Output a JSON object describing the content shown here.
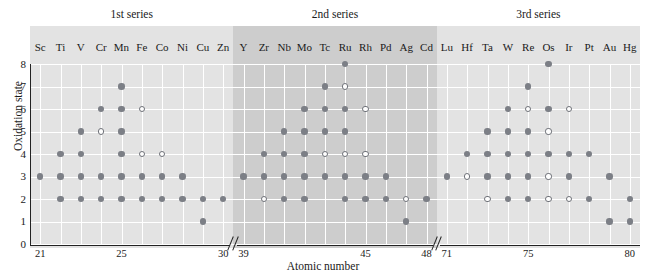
{
  "chart_data": {
    "type": "scatter",
    "title": "",
    "xlabel": "Atomic number",
    "ylabel": "Oxidation state",
    "ylim": [
      0,
      8
    ],
    "ytick_labels": [
      "0",
      "1",
      "2",
      "3",
      "4",
      "5",
      "6",
      "7",
      "8"
    ],
    "grid": true,
    "legend_position": "none",
    "axis_breaks": [
      "30/39",
      "48/71"
    ],
    "series_bands": [
      {
        "label": "1st series",
        "elements_from": "Sc",
        "elements_to": "Zn",
        "shade": "#e3e3e3"
      },
      {
        "label": "2nd series",
        "elements_from": "Y",
        "elements_to": "Cd",
        "shade": "#cdcdcd"
      },
      {
        "label": "3rd series",
        "elements_from": "Lu",
        "elements_to": "Hg",
        "shade": "#e3e3e3"
      }
    ],
    "xtick_labels": [
      "21",
      "25",
      "30",
      "39",
      "45",
      "48",
      "71",
      "75",
      "80"
    ],
    "marker_legend": {
      "filled": "common oxidation state",
      "open": "less common oxidation state"
    },
    "columns": [
      {
        "symbol": "Sc",
        "z": 21,
        "series": 1,
        "filled": [
          3
        ],
        "open": []
      },
      {
        "symbol": "Ti",
        "z": 22,
        "series": 1,
        "filled": [
          2,
          3,
          4
        ],
        "open": []
      },
      {
        "symbol": "V",
        "z": 23,
        "series": 1,
        "filled": [
          2,
          3,
          4,
          5
        ],
        "open": []
      },
      {
        "symbol": "Cr",
        "z": 24,
        "series": 1,
        "filled": [
          2,
          3,
          6
        ],
        "open": [
          5
        ]
      },
      {
        "symbol": "Mn",
        "z": 25,
        "series": 1,
        "filled": [
          2,
          3,
          4,
          5,
          6,
          7
        ],
        "open": []
      },
      {
        "symbol": "Fe",
        "z": 26,
        "series": 1,
        "filled": [
          2,
          3
        ],
        "open": [
          4,
          6
        ]
      },
      {
        "symbol": "Co",
        "z": 27,
        "series": 1,
        "filled": [
          2,
          3
        ],
        "open": [
          4
        ]
      },
      {
        "symbol": "Ni",
        "z": 28,
        "series": 1,
        "filled": [
          2,
          3
        ],
        "open": []
      },
      {
        "symbol": "Cu",
        "z": 29,
        "series": 1,
        "filled": [
          1,
          2
        ],
        "open": []
      },
      {
        "symbol": "Zn",
        "z": 30,
        "series": 1,
        "filled": [
          2
        ],
        "open": []
      },
      {
        "symbol": "Y",
        "z": 39,
        "series": 2,
        "filled": [
          3
        ],
        "open": []
      },
      {
        "symbol": "Zr",
        "z": 40,
        "series": 2,
        "filled": [
          3,
          4
        ],
        "open": [
          2
        ]
      },
      {
        "symbol": "Nb",
        "z": 41,
        "series": 2,
        "filled": [
          2,
          3,
          4,
          5
        ],
        "open": []
      },
      {
        "symbol": "Mo",
        "z": 42,
        "series": 2,
        "filled": [
          2,
          3,
          4,
          5,
          6
        ],
        "open": []
      },
      {
        "symbol": "Tc",
        "z": 43,
        "series": 2,
        "filled": [
          3,
          5,
          6,
          7
        ],
        "open": [
          4
        ]
      },
      {
        "symbol": "Ru",
        "z": 44,
        "series": 2,
        "filled": [
          2,
          3,
          5,
          6,
          8
        ],
        "open": [
          4,
          7
        ]
      },
      {
        "symbol": "Rh",
        "z": 45,
        "series": 2,
        "filled": [
          2,
          3
        ],
        "open": [
          4,
          6
        ]
      },
      {
        "symbol": "Pd",
        "z": 46,
        "series": 2,
        "filled": [
          2,
          3
        ],
        "open": []
      },
      {
        "symbol": "Ag",
        "z": 47,
        "series": 2,
        "filled": [
          1
        ],
        "open": [
          2
        ]
      },
      {
        "symbol": "Cd",
        "z": 48,
        "series": 2,
        "filled": [
          2
        ],
        "open": []
      },
      {
        "symbol": "Lu",
        "z": 71,
        "series": 3,
        "filled": [
          3
        ],
        "open": []
      },
      {
        "symbol": "Hf",
        "z": 72,
        "series": 3,
        "filled": [
          4
        ],
        "open": [
          3
        ]
      },
      {
        "symbol": "Ta",
        "z": 73,
        "series": 3,
        "filled": [
          3,
          4,
          5
        ],
        "open": [
          2
        ]
      },
      {
        "symbol": "W",
        "z": 74,
        "series": 3,
        "filled": [
          2,
          3,
          4,
          5,
          6
        ],
        "open": []
      },
      {
        "symbol": "Re",
        "z": 75,
        "series": 3,
        "filled": [
          2,
          3,
          4,
          5,
          7
        ],
        "open": [
          6
        ]
      },
      {
        "symbol": "Os",
        "z": 76,
        "series": 3,
        "filled": [
          4,
          6,
          8
        ],
        "open": [
          2,
          3,
          5
        ]
      },
      {
        "symbol": "Ir",
        "z": 77,
        "series": 3,
        "filled": [
          3,
          4
        ],
        "open": [
          2,
          6
        ]
      },
      {
        "symbol": "Pt",
        "z": 78,
        "series": 3,
        "filled": [
          2,
          4
        ],
        "open": []
      },
      {
        "symbol": "Au",
        "z": 79,
        "series": 3,
        "filled": [
          1,
          3
        ],
        "open": []
      },
      {
        "symbol": "Hg",
        "z": 80,
        "series": 3,
        "filled": [
          1,
          2
        ],
        "open": []
      }
    ]
  }
}
